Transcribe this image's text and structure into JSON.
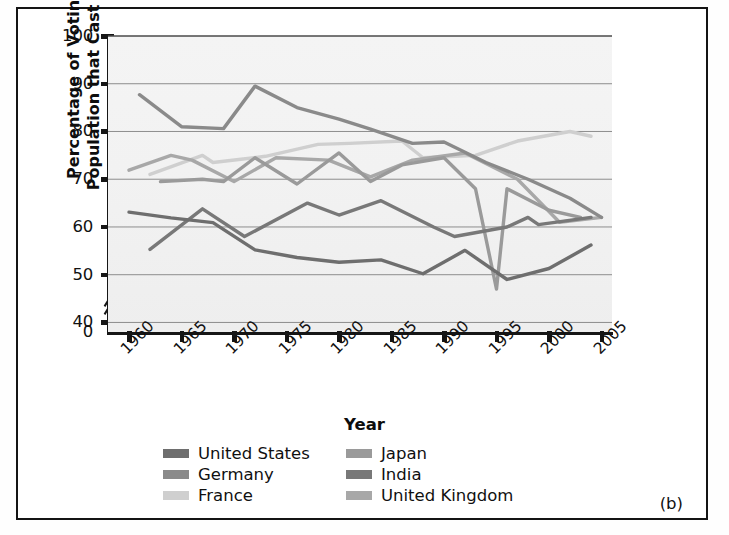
{
  "figure": {
    "panel_label": "(b)"
  },
  "axes": {
    "y_title_line1": "Percentage of Voting Age",
    "y_title_line2": "Population that Cast Ballots",
    "x_title": "Year",
    "y_ticks": [
      100,
      90,
      80,
      70,
      60,
      50,
      40,
      0
    ],
    "x_ticks": [
      1960,
      1965,
      1970,
      1975,
      1980,
      1985,
      1990,
      1995,
      2000,
      2005
    ],
    "axis_break": true
  },
  "legend": {
    "entries": [
      {
        "label": "United States",
        "color": "#6e6e6e",
        "column": "left"
      },
      {
        "label": "Germany",
        "color": "#8a8a8a",
        "column": "left"
      },
      {
        "label": "France",
        "color": "#cfcfcf",
        "column": "left"
      },
      {
        "label": "Japan",
        "color": "#9a9a9a",
        "column": "right"
      },
      {
        "label": "India",
        "color": "#787878",
        "column": "right"
      },
      {
        "label": "United Kingdom",
        "color": "#a8a8a8",
        "column": "right"
      }
    ]
  },
  "chart_data": {
    "type": "line",
    "title": "",
    "xlabel": "Year",
    "ylabel": "Percentage of Voting Age Population that Cast Ballots",
    "xlim": [
      1958,
      2006
    ],
    "ylim": [
      38,
      100
    ],
    "y_axis_broken_at": [
      0,
      40
    ],
    "grid": "horizontal",
    "legend_position": "bottom",
    "series": [
      {
        "name": "Germany",
        "color": "#8a8a8a",
        "x": [
          1961,
          1965,
          1969,
          1972,
          1976,
          1980,
          1983,
          1987,
          1990,
          1994,
          1998,
          2002,
          2005
        ],
        "values": [
          87.7,
          81.0,
          80.6,
          89.5,
          85.0,
          82.6,
          80.5,
          77.5,
          77.8,
          73.5,
          70.0,
          66.0,
          62.0
        ]
      },
      {
        "name": "France",
        "color": "#cfcfcf",
        "x": [
          1962,
          1967,
          1968,
          1973,
          1978,
          1981,
          1986,
          1988,
          1993,
          1997,
          2002,
          2004
        ],
        "values": [
          71.0,
          75.0,
          73.5,
          74.8,
          77.3,
          77.5,
          78.0,
          74.5,
          75.0,
          78.0,
          80.0,
          79.0
        ]
      },
      {
        "name": "United Kingdom",
        "color": "#a8a8a8",
        "x": [
          1960,
          1964,
          1966,
          1970,
          1974,
          1979,
          1983,
          1987,
          1992,
          1997,
          2001,
          2005
        ],
        "values": [
          71.9,
          75.0,
          74.0,
          69.5,
          74.5,
          74.0,
          70.5,
          74.0,
          75.5,
          70.0,
          61.0,
          62.0
        ]
      },
      {
        "name": "Japan",
        "color": "#9a9a9a",
        "x": [
          1963,
          1967,
          1969,
          1972,
          1976,
          1980,
          1983,
          1986,
          1990,
          1993,
          1995,
          1996,
          2000,
          2003
        ],
        "values": [
          69.5,
          70.0,
          69.5,
          74.5,
          69.0,
          75.5,
          69.5,
          73.0,
          74.5,
          68.0,
          47.0,
          68.0,
          63.5,
          62.0
        ]
      },
      {
        "name": "India",
        "color": "#787878",
        "x": [
          1962,
          1967,
          1971,
          1977,
          1980,
          1984,
          1989,
          1991,
          1996,
          1998,
          1999,
          2004
        ],
        "values": [
          55.3,
          63.8,
          58.0,
          65.0,
          62.5,
          65.5,
          60.0,
          58.0,
          60.0,
          62.0,
          60.5,
          62.0
        ]
      },
      {
        "name": "United States",
        "color": "#6e6e6e",
        "x": [
          1960,
          1964,
          1968,
          1972,
          1976,
          1980,
          1984,
          1988,
          1992,
          1996,
          2000,
          2004
        ],
        "values": [
          63.1,
          61.9,
          60.9,
          55.2,
          53.6,
          52.6,
          53.1,
          50.2,
          55.1,
          49.0,
          51.3,
          56.2
        ]
      }
    ]
  }
}
